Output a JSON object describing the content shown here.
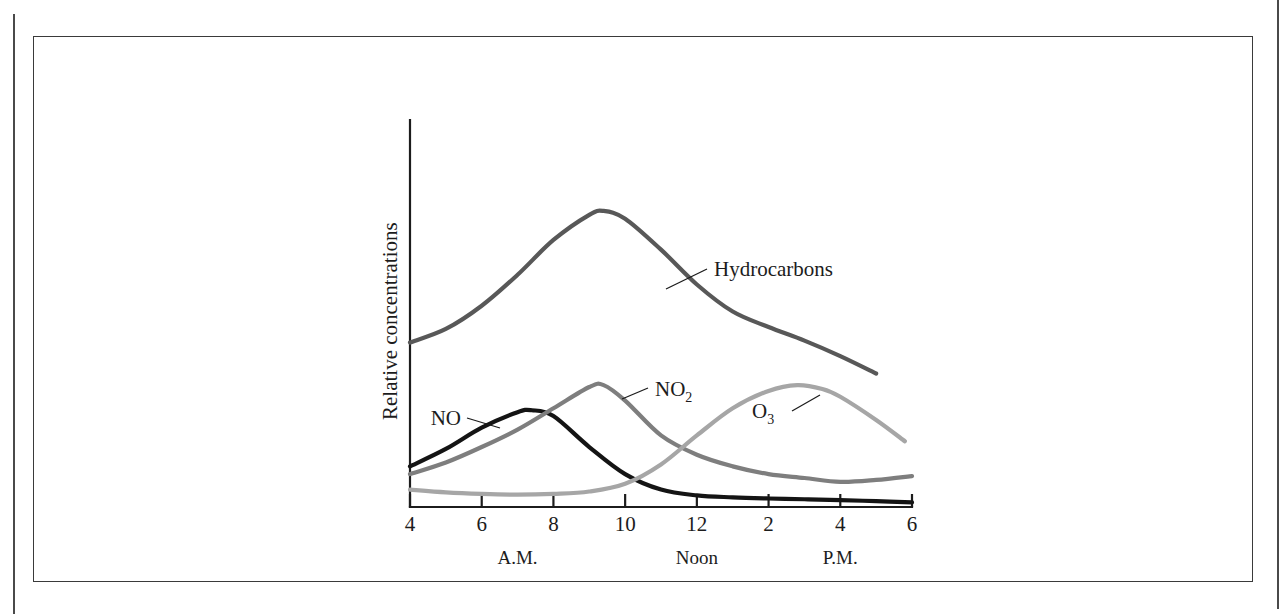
{
  "figure": {
    "frame_color": "#3a3a3a",
    "background": "#ffffff"
  },
  "axes": {
    "y_title": "Relative concentrations",
    "x_ticks": [
      "4",
      "6",
      "8",
      "10",
      "12",
      "2",
      "4",
      "6"
    ],
    "x_period_labels": [
      "A.M.",
      "Noon",
      "P.M."
    ],
    "axis_color": "#1c1c1c"
  },
  "labels": {
    "hydrocarbons": "Hydrocarbons",
    "no": "NO",
    "no2_base": "NO",
    "no2_sub": "2",
    "o3_base": "O",
    "o3_sub": "3"
  },
  "chart_data": {
    "type": "line",
    "title": "",
    "subtitle": "",
    "xlabel": "",
    "ylabel": "Relative concentrations",
    "grid": false,
    "legend": "inline-annotations",
    "x_axis": {
      "tick_labels": [
        "4",
        "6",
        "8",
        "10",
        "12",
        "2",
        "4",
        "6"
      ],
      "hours_24": [
        4,
        6,
        8,
        10,
        12,
        14,
        16,
        18
      ],
      "period_annotations": [
        {
          "label": "A.M.",
          "hour": 7
        },
        {
          "label": "Noon",
          "hour": 12
        },
        {
          "label": "P.M.",
          "hour": 16
        }
      ],
      "xlim": [
        4,
        18
      ]
    },
    "y_axis": {
      "tick_labels": [],
      "ylim": [
        0,
        1
      ],
      "note": "Unlabeled relative scale"
    },
    "series": [
      {
        "name": "Hydrocarbons",
        "color": "#585858",
        "width": 4.2,
        "x": [
          4,
          5,
          6,
          7,
          8,
          9,
          9.4,
          10,
          11,
          12,
          13,
          14,
          15,
          16,
          17
        ],
        "values": [
          0.425,
          0.46,
          0.52,
          0.6,
          0.69,
          0.755,
          0.765,
          0.745,
          0.665,
          0.575,
          0.505,
          0.465,
          0.43,
          0.39,
          0.345
        ]
      },
      {
        "name": "NO",
        "color": "#141414",
        "width": 4.2,
        "x": [
          4,
          5,
          6,
          7,
          7.4,
          8,
          9,
          10,
          11,
          12,
          13,
          14,
          15,
          16,
          17,
          18
        ],
        "values": [
          0.105,
          0.15,
          0.205,
          0.245,
          0.25,
          0.235,
          0.155,
          0.085,
          0.045,
          0.03,
          0.025,
          0.022,
          0.02,
          0.018,
          0.015,
          0.012
        ]
      },
      {
        "name": "NO2",
        "color": "#7e7e7e",
        "width": 4.2,
        "x": [
          4,
          5,
          6,
          7,
          8,
          9,
          9.4,
          10,
          11,
          12,
          13,
          14,
          15,
          16,
          17,
          18
        ],
        "values": [
          0.085,
          0.115,
          0.155,
          0.2,
          0.255,
          0.31,
          0.315,
          0.275,
          0.185,
          0.135,
          0.105,
          0.085,
          0.075,
          0.065,
          0.07,
          0.08
        ]
      },
      {
        "name": "O3",
        "color": "#a6a6a6",
        "width": 4.2,
        "x": [
          4,
          5,
          6,
          7,
          8,
          9,
          10,
          11,
          12,
          13,
          14,
          14.8,
          15.5,
          16,
          17,
          17.8
        ],
        "values": [
          0.045,
          0.038,
          0.034,
          0.032,
          0.034,
          0.04,
          0.06,
          0.11,
          0.185,
          0.255,
          0.3,
          0.315,
          0.305,
          0.285,
          0.225,
          0.17
        ]
      }
    ],
    "annotations": [
      {
        "text": "Hydrocarbons",
        "attaches_to": "Hydrocarbons"
      },
      {
        "text": "NO",
        "attaches_to": "NO"
      },
      {
        "text": "NO2",
        "attaches_to": "NO2"
      },
      {
        "text": "O3",
        "attaches_to": "O3"
      }
    ]
  }
}
